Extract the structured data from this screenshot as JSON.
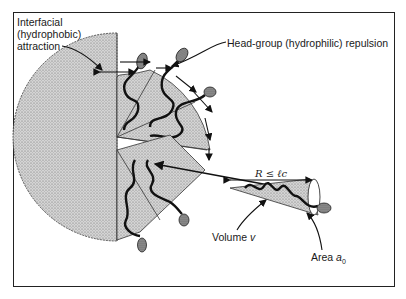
{
  "figure": {
    "labels": {
      "interfacial_line1": "Interfacial",
      "interfacial_line2": "(hydrophobic)",
      "interfacial_line3": "attraction",
      "headgroup": "Head-group (hydrophilic) repulsion",
      "critical_length": "R ≤ ℓc",
      "volume_prefix": "Volume",
      "volume_symbol": "v",
      "area_prefix": "Area",
      "area_symbol": "a",
      "area_subscript": "0"
    },
    "colors": {
      "frame": "#222222",
      "stipple_fill": "#c8c8c8",
      "chain": "#111111",
      "head_fill": "#8a8a8a"
    },
    "elements": [
      {
        "name": "micelle-core",
        "type": "semicircle-stippled"
      },
      {
        "name": "upper-wedge-sectors",
        "count": 3
      },
      {
        "name": "lower-wedge-sector",
        "count": 2
      },
      {
        "name": "detached-cone",
        "describes": "single surfactant packing cone"
      },
      {
        "name": "insertion-arrow",
        "direction": "cone into micelle"
      }
    ]
  }
}
